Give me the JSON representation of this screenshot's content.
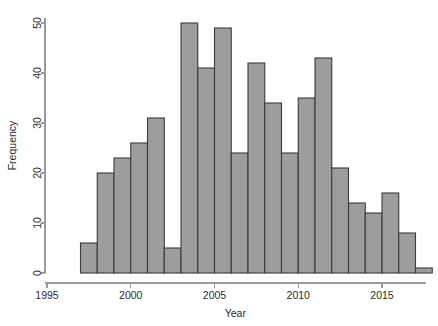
{
  "chart_data": {
    "type": "bar",
    "title": "",
    "subtitle": "",
    "xlabel": "Year",
    "ylabel": "Frequency",
    "xlim": [
      1995,
      2017.6
    ],
    "ylim": [
      0,
      51
    ],
    "grid": false,
    "legend": null,
    "bin_width": 1,
    "x_tick_labels": [
      "1995",
      "2000",
      "2005",
      "2010",
      "2015"
    ],
    "x_tick_values": [
      1995,
      2000,
      2005,
      2010,
      2015
    ],
    "y_tick_labels": [
      "0",
      "10",
      "20",
      "30",
      "40",
      "50"
    ],
    "y_tick_values": [
      0,
      10,
      20,
      30,
      40,
      50
    ],
    "categories": [
      "1997",
      "1998",
      "1999",
      "2000",
      "2001",
      "2002",
      "2003",
      "2004",
      "2005",
      "2006",
      "2007",
      "2008",
      "2009",
      "2010",
      "2011",
      "2012",
      "2013",
      "2014",
      "2015",
      "2016",
      "2017"
    ],
    "bin_starts": [
      1997,
      1998,
      1999,
      2000,
      2001,
      2002,
      2003,
      2004,
      2005,
      2006,
      2007,
      2008,
      2009,
      2010,
      2011,
      2012,
      2013,
      2014,
      2015,
      2016,
      2017
    ],
    "values": [
      6,
      20,
      23,
      26,
      31,
      5,
      50,
      41,
      49,
      24,
      42,
      34,
      24,
      35,
      43,
      21,
      14,
      12,
      16,
      8,
      1
    ],
    "bar_fill_color": "#9d9d9d",
    "bar_edge_color": "#3a3a3a",
    "axis_color": "#9a9a9a",
    "text_color": "#2b2b2b",
    "background_color": "#ffffff"
  }
}
